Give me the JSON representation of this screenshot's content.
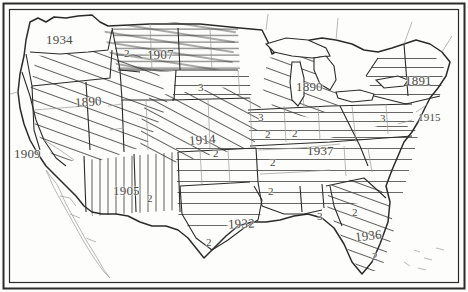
{
  "figure": {
    "name": "united-states-hatched-zone-map",
    "background_color": "#fdfdfb",
    "ink_color": "#2b2b2b",
    "label_color": "#4a4a46",
    "border": {
      "outer_color": "#2b2b2b",
      "inner_color": "#2b2b2b"
    }
  },
  "labels": {
    "years": [
      {
        "id": "washington",
        "text": "1934",
        "x": 46,
        "y": 32,
        "rotate": 0
      },
      {
        "id": "dakotas",
        "text": "1907",
        "x": 147,
        "y": 47,
        "rotate": -2
      },
      {
        "id": "great-basin",
        "text": "1890",
        "x": 75,
        "y": 94,
        "rotate": -4
      },
      {
        "id": "michigan",
        "text": "1890",
        "x": 296,
        "y": 79,
        "rotate": 0
      },
      {
        "id": "mid-atlantic",
        "text": "1891",
        "x": 405,
        "y": 73,
        "rotate": 0
      },
      {
        "id": "chesapeake",
        "text": "1915",
        "x": 418,
        "y": 111,
        "rotate": 0
      },
      {
        "id": "california",
        "text": "1909",
        "x": 14,
        "y": 146,
        "rotate": 0
      },
      {
        "id": "plains",
        "text": "1914",
        "x": 189,
        "y": 132,
        "rotate": -4
      },
      {
        "id": "ohio-valley",
        "text": "1937",
        "x": 307,
        "y": 143,
        "rotate": 0
      },
      {
        "id": "southwest",
        "text": "1905",
        "x": 113,
        "y": 183,
        "rotate": 0
      },
      {
        "id": "gulf",
        "text": "1932",
        "x": 228,
        "y": 216,
        "rotate": -2
      },
      {
        "id": "southeast",
        "text": "1936",
        "x": 355,
        "y": 228,
        "rotate": -6
      }
    ],
    "numbers": [
      {
        "id": "n-dakotas-2",
        "text": "2",
        "x": 124,
        "y": 47
      },
      {
        "id": "n-montana-3",
        "text": "3",
        "x": 198,
        "y": 81
      },
      {
        "id": "n-midwest-3",
        "text": "3",
        "x": 258,
        "y": 111
      },
      {
        "id": "n-appalach-3",
        "text": "3",
        "x": 380,
        "y": 112
      },
      {
        "id": "n-plains-2",
        "text": "2",
        "x": 292,
        "y": 127
      },
      {
        "id": "n-ozark-2",
        "text": "2",
        "x": 265,
        "y": 128
      },
      {
        "id": "n-kansas-2",
        "text": "2",
        "x": 213,
        "y": 147
      },
      {
        "id": "n-tennessee-2",
        "text": "2",
        "x": 270,
        "y": 156
      },
      {
        "id": "n-mississippi-2",
        "text": "2",
        "x": 268,
        "y": 185
      },
      {
        "id": "n-newmexico-2",
        "text": "2",
        "x": 147,
        "y": 192
      },
      {
        "id": "n-louisiana-3",
        "text": "3",
        "x": 317,
        "y": 210
      },
      {
        "id": "n-texas-2",
        "text": "2",
        "x": 206,
        "y": 236
      },
      {
        "id": "n-georgia-2",
        "text": "2",
        "x": 352,
        "y": 206
      },
      {
        "id": "n-florida-2",
        "text": "2",
        "x": 372,
        "y": 250
      }
    ]
  }
}
